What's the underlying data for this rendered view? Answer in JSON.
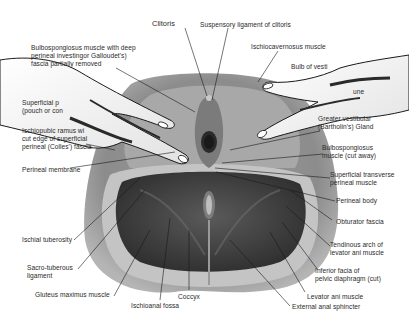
{
  "diagram": {
    "colors": {
      "background": "#ffffff",
      "label_text": "#2a2a2a",
      "leader_line": "#1a1a1a",
      "tissue_light": "#b9b9b9",
      "tissue_mid": "#8a8a8a",
      "tissue_dark": "#3c3c3c",
      "glove_hand": "#f4f4f4"
    },
    "labels": {
      "clitoris": "Clitoris",
      "suspensory_ligament": "Suspensory ligament of clitoris",
      "bulbospongiosus_deep": "Bulbospongiosus muscle with deep\nperineal investingor Galloudet's)\nfascia partially removed",
      "ischiocavernosus": "Ischiocavernosus muscle",
      "bulb_of_vestibule": "Bulb of vesti",
      "right_partial": "une",
      "superficial_pouch": "Superficial p\n(pouch or con",
      "ischiopubic_ramus": "Ischiopubic ramus wi\ncut edge of superficial\nperineal (Colles') fascia",
      "perineal_membrane": "Perineal membrane",
      "greater_vestibular": "Greater vestibular\n(Bartholin's) Gland",
      "bulbospongiosus_cut": "Bulbospongiosus\nmuscle (cut away)",
      "superficial_transverse": "Superficial transverse\nperineal muscle",
      "perineal_body": "Perineal body",
      "obturator_fascia": "Obturator fascia",
      "tendinous_arch": "Tendinous arch of\nlevator ani muscle",
      "inferior_fascia": "Inferior facia of\npelvic diaphragm (cut)",
      "levator_ani": "Levator ani muscle",
      "external_anal_sphincter": "External anal sphincter",
      "coccyx": "Coccyx",
      "ischioanal_fossa": "Ischioanal fossa",
      "gluteus_maximus": "Gluteus maximus muscle",
      "sacrotuberous": "Sacro-tuberous\nligament",
      "ischial_tuberosity": "Ischial tuberosity"
    }
  }
}
